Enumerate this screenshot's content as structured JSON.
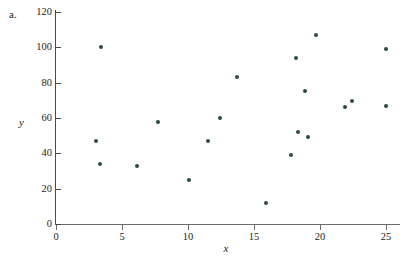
{
  "panel": {
    "label": "a."
  },
  "chart_data": {
    "type": "scatter",
    "title": "",
    "subtitle": "",
    "xlabel": "x",
    "ylabel": "y",
    "xlim": [
      0,
      26
    ],
    "ylim": [
      0,
      120
    ],
    "xticks": [
      0,
      5,
      10,
      15,
      20,
      25
    ],
    "yticks": [
      0,
      20,
      40,
      60,
      80,
      100,
      120
    ],
    "xtick_labels": [
      "0",
      "5",
      "10",
      "15",
      "20",
      "25"
    ],
    "ytick_labels": [
      "0",
      "20",
      "40",
      "60",
      "80",
      "100",
      "120"
    ],
    "grid": false,
    "legend": null,
    "marker_color": "#2d4a44",
    "series": [
      {
        "name": "",
        "points": [
          {
            "x": 3.0,
            "y": 47
          },
          {
            "x": 3.3,
            "y": 34
          },
          {
            "x": 3.4,
            "y": 100
          },
          {
            "x": 6.1,
            "y": 33
          },
          {
            "x": 7.7,
            "y": 58
          },
          {
            "x": 10.1,
            "y": 25
          },
          {
            "x": 11.5,
            "y": 47
          },
          {
            "x": 12.4,
            "y": 60
          },
          {
            "x": 13.7,
            "y": 83
          },
          {
            "x": 15.9,
            "y": 12
          },
          {
            "x": 17.8,
            "y": 39
          },
          {
            "x": 18.2,
            "y": 94
          },
          {
            "x": 18.3,
            "y": 52
          },
          {
            "x": 18.9,
            "y": 75
          },
          {
            "x": 19.1,
            "y": 49.5
          },
          {
            "x": 19.7,
            "y": 107
          },
          {
            "x": 21.9,
            "y": 66
          },
          {
            "x": 22.4,
            "y": 69.5
          },
          {
            "x": 25.0,
            "y": 99
          },
          {
            "x": 25.0,
            "y": 67
          }
        ]
      }
    ]
  }
}
